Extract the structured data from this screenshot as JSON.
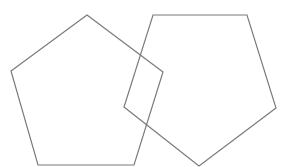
{
  "diagram": {
    "stroke_color": "#7a7a7a",
    "background": "#ffffff",
    "shapes": [
      {
        "name": "left-pentagon",
        "type": "pentagon",
        "orientation": "point-up",
        "points": "87,15 163,72 134,165 38,165 11,71"
      },
      {
        "name": "right-pentagon",
        "type": "pentagon",
        "orientation": "point-down",
        "points": "153,15 247,15 276,108 199,166 124,107"
      }
    ]
  }
}
